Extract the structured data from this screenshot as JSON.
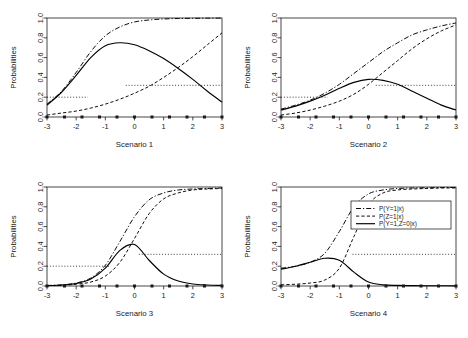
{
  "figure": {
    "title": "",
    "background_color": "#ffffff",
    "line_color": "#000000",
    "panel_count": 4,
    "layout": "2x2 grid"
  },
  "axes": {
    "ylabel": "Probabilities",
    "y_ticks": [
      "0.0",
      "0.2",
      "0.4",
      "0.6",
      "0.8",
      "1.0"
    ],
    "y_tick_values": [
      0.0,
      0.2,
      0.4,
      0.6,
      0.8,
      1.0
    ],
    "x_ticks": [
      "-3",
      "-2",
      "-1",
      "0",
      "1",
      "2",
      "3"
    ],
    "x_tick_values": [
      -3,
      -2,
      -1,
      0,
      1,
      2,
      3
    ],
    "xlim": [
      -3,
      3
    ],
    "ylim": [
      0.0,
      1.0
    ]
  },
  "legend": {
    "position": "top-right of Scenario 4 panel",
    "entries": [
      {
        "label": "P(Y=1|x)",
        "style": "dashdot"
      },
      {
        "label": "P(Z=1|x)",
        "style": "dashed"
      },
      {
        "label": "P(Y=1,Z=0|x)",
        "style": "solid"
      }
    ]
  },
  "chart_data": [
    {
      "type": "line",
      "title": "Scenario 1",
      "xlabel": "Scenario 1",
      "ylabel": "Probabilities",
      "xlim": [
        -3,
        3
      ],
      "ylim": [
        0.0,
        1.0
      ],
      "grid": false,
      "legend": false,
      "x": [
        -3,
        -2.5,
        -2,
        -1.5,
        -1,
        -0.5,
        0,
        0.5,
        1,
        1.5,
        2,
        2.5,
        3
      ],
      "series": [
        {
          "name": "P(Y=1|x)",
          "style": "dashdot",
          "values": [
            0.13,
            0.26,
            0.45,
            0.66,
            0.82,
            0.91,
            0.96,
            0.98,
            0.99,
            0.995,
            0.997,
            0.998,
            0.999
          ]
        },
        {
          "name": "P(Z=1|x)",
          "style": "dashed",
          "values": [
            0.02,
            0.04,
            0.06,
            0.09,
            0.13,
            0.18,
            0.24,
            0.31,
            0.4,
            0.5,
            0.61,
            0.73,
            0.85
          ]
        },
        {
          "name": "P(Y=1,Z=0|x)",
          "style": "solid",
          "values": [
            0.12,
            0.25,
            0.42,
            0.6,
            0.72,
            0.75,
            0.73,
            0.67,
            0.59,
            0.49,
            0.38,
            0.26,
            0.15
          ]
        }
      ],
      "reference_lines": [
        {
          "y": 0.2,
          "style": "dotted",
          "x_from": -3,
          "x_to": -1.6
        },
        {
          "y": 0.32,
          "style": "dotted",
          "x_from": -0.3,
          "x_to": 3
        }
      ],
      "rug_points_y": 0.0,
      "rug_points_x": [
        -3.0,
        -2.4,
        -1.8,
        -1.2,
        -0.6,
        0.0,
        0.6,
        1.2,
        1.8,
        2.4,
        3.0
      ]
    },
    {
      "type": "line",
      "title": "Scenario 2",
      "xlabel": "Scenario 2",
      "ylabel": "Probabilities",
      "xlim": [
        -3,
        3
      ],
      "ylim": [
        0.0,
        1.0
      ],
      "grid": false,
      "legend": false,
      "x": [
        -3,
        -2.5,
        -2,
        -1.5,
        -1,
        -0.5,
        0,
        0.5,
        1,
        1.5,
        2,
        2.5,
        3
      ],
      "series": [
        {
          "name": "P(Y=1|x)",
          "style": "dashdot",
          "values": [
            0.08,
            0.12,
            0.17,
            0.24,
            0.33,
            0.44,
            0.55,
            0.66,
            0.75,
            0.83,
            0.88,
            0.92,
            0.95
          ]
        },
        {
          "name": "P(Z=1|x)",
          "style": "dashed",
          "values": [
            0.02,
            0.04,
            0.07,
            0.11,
            0.16,
            0.23,
            0.33,
            0.45,
            0.57,
            0.69,
            0.79,
            0.87,
            0.93
          ]
        },
        {
          "name": "P(Y=1,Z=0|x)",
          "style": "solid",
          "values": [
            0.07,
            0.11,
            0.16,
            0.22,
            0.29,
            0.35,
            0.38,
            0.37,
            0.33,
            0.26,
            0.19,
            0.12,
            0.07
          ]
        }
      ],
      "reference_lines": [
        {
          "y": 0.2,
          "style": "dotted",
          "x_from": -3,
          "x_to": -1.4
        },
        {
          "y": 0.32,
          "style": "dotted",
          "x_from": 0.25,
          "x_to": 3
        }
      ],
      "rug_points_y": 0.0,
      "rug_points_x": [
        -3.0,
        -2.4,
        -1.8,
        -1.2,
        -0.6,
        0.0,
        0.6,
        1.2,
        1.8,
        2.4,
        3.0
      ]
    },
    {
      "type": "line",
      "title": "Scenario 3",
      "xlabel": "Scenario 3",
      "ylabel": "Probabilities",
      "xlim": [
        -3,
        3
      ],
      "ylim": [
        0.0,
        1.0
      ],
      "grid": false,
      "legend": false,
      "x": [
        -3,
        -2.5,
        -2,
        -1.5,
        -1,
        -0.5,
        0,
        0.5,
        1,
        1.5,
        2,
        2.5,
        3
      ],
      "series": [
        {
          "name": "P(Y=1|x)",
          "style": "dashdot",
          "values": [
            0.005,
            0.012,
            0.03,
            0.08,
            0.21,
            0.45,
            0.7,
            0.87,
            0.94,
            0.97,
            0.98,
            0.985,
            0.99
          ]
        },
        {
          "name": "P(Z=1|x)",
          "style": "dashed",
          "values": [
            0.003,
            0.007,
            0.018,
            0.04,
            0.1,
            0.24,
            0.48,
            0.73,
            0.88,
            0.94,
            0.97,
            0.98,
            0.985
          ]
        },
        {
          "name": "P(Y=1,Z=0|x)",
          "style": "solid",
          "values": [
            0.004,
            0.01,
            0.025,
            0.07,
            0.18,
            0.36,
            0.42,
            0.26,
            0.12,
            0.05,
            0.02,
            0.01,
            0.006
          ]
        }
      ],
      "reference_lines": [
        {
          "y": 0.2,
          "style": "dotted",
          "x_from": -3,
          "x_to": -0.85
        },
        {
          "y": 0.32,
          "style": "dotted",
          "x_from": 0.15,
          "x_to": 3
        }
      ],
      "rug_points_y": 0.0,
      "rug_points_x": [
        -3.0,
        -2.4,
        -1.8,
        -1.2,
        -0.6,
        0.0,
        0.6,
        1.2,
        1.8,
        2.4,
        3.0
      ]
    },
    {
      "type": "line",
      "title": "Scenario 4",
      "xlabel": "Scenario 4",
      "ylabel": "Probabilities",
      "xlim": [
        -3,
        3
      ],
      "ylim": [
        0.0,
        1.0
      ],
      "grid": false,
      "legend": true,
      "x": [
        -3,
        -2.5,
        -2,
        -1.5,
        -1,
        -0.5,
        0,
        0.5,
        1,
        1.5,
        2,
        2.5,
        3
      ],
      "series": [
        {
          "name": "P(Y=1|x)",
          "style": "dashdot",
          "values": [
            0.18,
            0.2,
            0.24,
            0.33,
            0.55,
            0.8,
            0.93,
            0.97,
            0.985,
            0.99,
            0.992,
            0.994,
            0.995
          ]
        },
        {
          "name": "P(Z=1|x)",
          "style": "dashed",
          "values": [
            0.012,
            0.018,
            0.03,
            0.06,
            0.18,
            0.5,
            0.82,
            0.94,
            0.97,
            0.98,
            0.985,
            0.99,
            0.99
          ]
        },
        {
          "name": "P(Y=1,Z=0|x)",
          "style": "solid",
          "values": [
            0.17,
            0.2,
            0.24,
            0.28,
            0.26,
            0.14,
            0.04,
            0.012,
            0.006,
            0.004,
            0.003,
            0.003,
            0.002
          ]
        }
      ],
      "reference_lines": [
        {
          "y": 0.32,
          "style": "dotted",
          "x_from": -0.55,
          "x_to": 3
        }
      ],
      "rug_points_y": 0.0,
      "rug_points_x": [
        -3.0,
        -2.4,
        -1.8,
        -1.2,
        -0.6,
        0.0,
        0.6,
        1.2,
        1.8,
        2.4,
        3.0
      ]
    }
  ]
}
